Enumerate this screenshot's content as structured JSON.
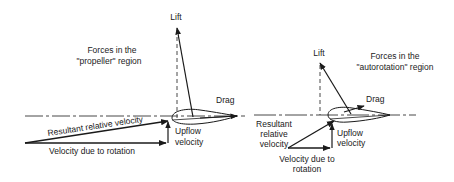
{
  "left_panel": {
    "title_line1": "Forces in the",
    "title_line2": "\"propeller\" region",
    "lift": "Lift",
    "drag": "Drag",
    "resultant": "Resultant relative velocity",
    "upflow_line1": "Upflow",
    "upflow_line2": "velocity",
    "rotation": "Velocity due to rotation"
  },
  "right_panel": {
    "title_line1": "Forces in the",
    "title_line2": "\"autorotation\" region",
    "lift": "Lift",
    "drag": "Drag",
    "resultant_line1": "Resultant",
    "resultant_line2": "relative",
    "resultant_line3": "velocity",
    "upflow_line1": "Upflow",
    "upflow_line2": "velocity",
    "rotation_line1": "Velocity due to",
    "rotation_line2": "rotation"
  },
  "colors": {
    "ink": "#1a1a1a",
    "background": "#ffffff"
  }
}
